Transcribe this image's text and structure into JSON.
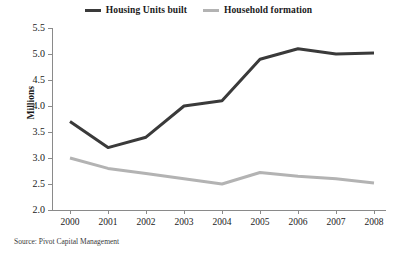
{
  "chart_data": {
    "type": "line",
    "title": "",
    "subtitle": "",
    "xlabel": "",
    "ylabel": "Millions",
    "categories": [
      "2000",
      "2001",
      "2002",
      "2003",
      "2004",
      "2005",
      "2006",
      "2007",
      "2008"
    ],
    "x": [
      2000,
      2001,
      2002,
      2003,
      2004,
      2005,
      2006,
      2007,
      2008
    ],
    "series": [
      {
        "name": "Housing Units built",
        "color": "#3a3a3a",
        "values": [
          3.7,
          3.2,
          3.4,
          4.0,
          4.1,
          4.9,
          5.1,
          5.0,
          5.02
        ]
      },
      {
        "name": "Household formation",
        "color": "#b3b3b3",
        "values": [
          3.0,
          2.8,
          2.7,
          2.6,
          2.5,
          2.72,
          2.65,
          2.6,
          2.52
        ]
      }
    ],
    "ylim": [
      2.0,
      5.5
    ],
    "yticks": [
      2.0,
      2.5,
      3.0,
      3.5,
      4.0,
      4.5,
      5.0,
      5.5
    ],
    "ytick_labels": [
      "2.0",
      "2.5",
      "3.0",
      "3.5",
      "4.0",
      "4.5",
      "5.0",
      "5.5"
    ],
    "grid": false,
    "legend_position": "top-center"
  },
  "legend": {
    "entries": [
      {
        "label": "Housing Units built",
        "color": "#3a3a3a"
      },
      {
        "label": "Household formation",
        "color": "#b3b3b3"
      }
    ]
  },
  "axes": {
    "y_title": "Millions"
  },
  "footer": {
    "source": "Source: Pivot Capital Management"
  }
}
